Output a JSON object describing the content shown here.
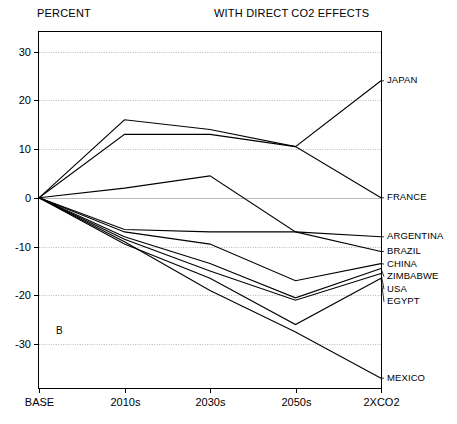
{
  "header": {
    "y_axis_title": "PERCENT",
    "panel_title": "WITH DIRECT CO2 EFFECTS",
    "panel_letter": "B"
  },
  "chart_data": {
    "type": "line",
    "title": "WITH DIRECT CO2 EFFECTS",
    "xlabel": "",
    "ylabel": "PERCENT",
    "grid": true,
    "legend_position": "right-inline-labels",
    "categories": [
      "BASE",
      "2010s",
      "2030s",
      "2050s",
      "2XCO2"
    ],
    "xticks": [
      "BASE",
      "2010s",
      "2030s",
      "2050s",
      "2XCO2"
    ],
    "yticks": [
      30,
      20,
      10,
      0,
      -10,
      -20,
      -30
    ],
    "ylim": [
      -39,
      34
    ],
    "series": [
      {
        "name": "JAPAN",
        "values": [
          0,
          16,
          14,
          10.5,
          24
        ]
      },
      {
        "name": "FRANCE",
        "values": [
          0,
          13,
          13,
          10.5,
          0
        ]
      },
      {
        "name": "ARGENTINA",
        "values": [
          0,
          2,
          4.5,
          -7,
          -8
        ]
      },
      {
        "name": "BRAZIL",
        "values": [
          0,
          -6.5,
          -7,
          -7,
          -11
        ]
      },
      {
        "name": "CHINA",
        "values": [
          0,
          -7,
          -9.5,
          -17,
          -13.5
        ]
      },
      {
        "name": "ZIMBABWE",
        "values": [
          0,
          -8,
          -13.5,
          -20.5,
          -14.5
        ]
      },
      {
        "name": "USA",
        "values": [
          0,
          -8.5,
          -15,
          -21,
          -15.5
        ]
      },
      {
        "name": "EGYPT",
        "values": [
          0,
          -9.5,
          -16.5,
          -26,
          -16.5
        ]
      },
      {
        "name": "MEXICO",
        "values": [
          0,
          -9,
          -19,
          -27.5,
          -37
        ]
      }
    ]
  }
}
